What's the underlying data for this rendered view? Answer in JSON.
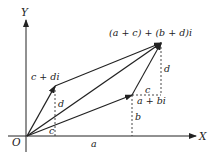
{
  "diagram": {
    "axes": {
      "x_label": "X",
      "y_label": "Y",
      "origin_label": "O"
    },
    "points": {
      "z1": "a + bi",
      "z2": "c + di",
      "sum": "(a + c) + (b + d)i"
    },
    "segment_labels": {
      "a": "a",
      "b": "b",
      "c_lower": "c",
      "d_lower": "d",
      "c_upper": "c",
      "d_upper": "d"
    },
    "colors": {
      "ink": "#222222",
      "background": "#ffffff"
    }
  }
}
